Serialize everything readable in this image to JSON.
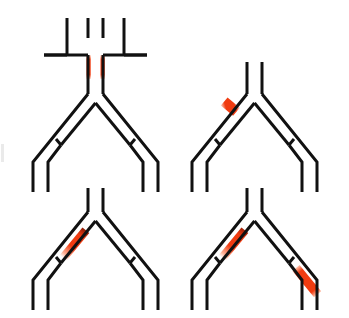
{
  "figure": {
    "title": "",
    "background_color": "#ffffff",
    "wall_color": "#111111",
    "highlight_color": "#f03c11",
    "highlight_color_light": "#ffd9c9",
    "wall_width_px": 3,
    "panel_count": 4
  },
  "panels": [
    {
      "id": "panel-1",
      "position": "top-left",
      "label": "",
      "has_inlet_cross": true,
      "inlet_description": "Vertical inlet channel above the bifurcation with two horizontal cross arms (upper arms and lower arms) forming a cross/T junction",
      "highlights": [
        {
          "name": "inlet-left-wall-highlight",
          "location": "inlet channel left wall",
          "style": "solid",
          "color": "#f03c11"
        },
        {
          "name": "inlet-right-wall-highlight",
          "location": "inlet channel right wall",
          "style": "solid",
          "color": "#f03c11"
        }
      ]
    },
    {
      "id": "panel-2",
      "position": "top-right",
      "label": "",
      "has_inlet_cross": false,
      "inlet_description": "Plain vertical inlet stubs above the bifurcation apex",
      "highlights": [
        {
          "name": "left-branch-inner-wall-highlight",
          "location": "left branch inner wall, upper segment",
          "style": "solid-short",
          "color": "#f03c11"
        }
      ]
    },
    {
      "id": "panel-3",
      "position": "bottom-left",
      "label": "",
      "has_inlet_cross": false,
      "inlet_description": "Plain vertical inlet stubs above the bifurcation apex",
      "highlights": [
        {
          "name": "left-branch-inner-wall-gradient-highlight",
          "location": "left branch inner wall, extended segment fading toward apex",
          "style": "gradient",
          "color": "#f03c11"
        }
      ]
    },
    {
      "id": "panel-4",
      "position": "bottom-right",
      "label": "",
      "has_inlet_cross": false,
      "inlet_description": "Plain vertical inlet stubs above the bifurcation apex",
      "highlights": [
        {
          "name": "left-branch-inner-wall-gradient-highlight",
          "location": "left branch inner wall, extended segment fading toward apex",
          "style": "gradient",
          "color": "#f03c11"
        },
        {
          "name": "right-branch-inner-wall-highlight",
          "location": "right branch inner wall, lower segment past the side tap",
          "style": "solid-long",
          "color": "#f03c11"
        }
      ]
    }
  ]
}
